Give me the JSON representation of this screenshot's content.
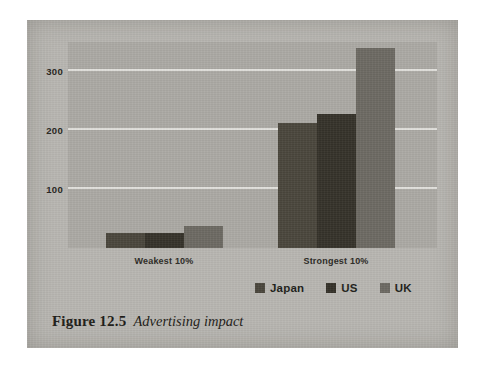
{
  "figure": {
    "caption_label": "Figure 12.5",
    "caption_title": "Advertising impact"
  },
  "colors": {
    "page_background": "#ffffff",
    "card_background": "#b8b6b1",
    "plot_background": "#aba9a4",
    "gridline": "#e8e7e3",
    "japan": "#4a463c",
    "us": "#35322a",
    "uk": "#6d6a63",
    "text": "#1d1b17"
  },
  "chart_data": {
    "type": "bar",
    "title": "Advertising impact",
    "xlabel": "",
    "ylabel": "",
    "categories": [
      "Weakest 10%",
      "Strongest 10%"
    ],
    "series": [
      {
        "name": "Japan",
        "color": "#4a463c",
        "values": [
          25,
          213
        ]
      },
      {
        "name": "US",
        "color": "#35322a",
        "values": [
          25,
          228
        ]
      },
      {
        "name": "UK",
        "color": "#6d6a63",
        "values": [
          37,
          340
        ]
      }
    ],
    "yticks": [
      100,
      200,
      300
    ],
    "ytick_labels": [
      "100",
      "200",
      "300"
    ],
    "ylim": [
      0,
      350
    ],
    "grid": true,
    "grid_axis": "y",
    "legend": [
      "Japan",
      "US",
      "UK"
    ],
    "legend_position": "bottom-right",
    "bars_grouped": true,
    "bar_gap": 0
  }
}
